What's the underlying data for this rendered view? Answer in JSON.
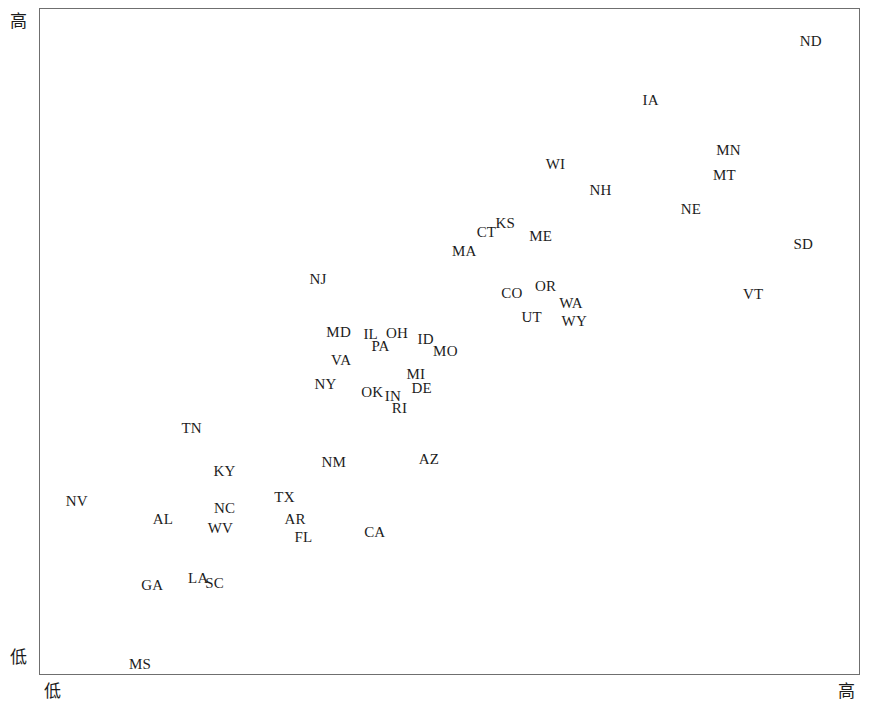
{
  "chart_data": {
    "type": "scatter",
    "title": "",
    "xlabel": "",
    "ylabel": "",
    "xlim": [
      0,
      100
    ],
    "ylim": [
      0,
      100
    ],
    "grid": false,
    "legend": "none",
    "axis_extremes": {
      "y_high": "高",
      "y_low": "低",
      "x_low": "低",
      "x_high": "高"
    },
    "point_label_field": "state",
    "points": [
      {
        "state": "ND",
        "x": 94.0,
        "y": 95.0
      },
      {
        "state": "IA",
        "x": 74.5,
        "y": 86.2
      },
      {
        "state": "MN",
        "x": 84.0,
        "y": 78.7
      },
      {
        "state": "MT",
        "x": 83.5,
        "y": 74.9
      },
      {
        "state": "WI",
        "x": 62.9,
        "y": 76.6
      },
      {
        "state": "NH",
        "x": 68.4,
        "y": 72.7
      },
      {
        "state": "NE",
        "x": 79.4,
        "y": 69.8
      },
      {
        "state": "KS",
        "x": 56.8,
        "y": 67.8
      },
      {
        "state": "CT",
        "x": 54.5,
        "y": 66.4
      },
      {
        "state": "ME",
        "x": 61.1,
        "y": 65.8
      },
      {
        "state": "MA",
        "x": 51.8,
        "y": 63.6
      },
      {
        "state": "SD",
        "x": 93.1,
        "y": 64.6
      },
      {
        "state": "NJ",
        "x": 34.0,
        "y": 59.3
      },
      {
        "state": "OR",
        "x": 61.7,
        "y": 58.3
      },
      {
        "state": "CO",
        "x": 57.6,
        "y": 57.3
      },
      {
        "state": "WA",
        "x": 64.8,
        "y": 55.8
      },
      {
        "state": "VT",
        "x": 87.0,
        "y": 57.1
      },
      {
        "state": "UT",
        "x": 60.0,
        "y": 53.6
      },
      {
        "state": "WY",
        "x": 65.2,
        "y": 53.0
      },
      {
        "state": "MD",
        "x": 36.5,
        "y": 51.4
      },
      {
        "state": "IL",
        "x": 40.4,
        "y": 51.1
      },
      {
        "state": "OH",
        "x": 43.6,
        "y": 51.3
      },
      {
        "state": "ID",
        "x": 47.1,
        "y": 50.4
      },
      {
        "state": "PA",
        "x": 41.6,
        "y": 49.3
      },
      {
        "state": "MO",
        "x": 49.5,
        "y": 48.6
      },
      {
        "state": "VA",
        "x": 36.8,
        "y": 47.2
      },
      {
        "state": "MI",
        "x": 45.9,
        "y": 45.2
      },
      {
        "state": "NY",
        "x": 34.9,
        "y": 43.7
      },
      {
        "state": "DE",
        "x": 46.6,
        "y": 43.1
      },
      {
        "state": "OK",
        "x": 40.6,
        "y": 42.5
      },
      {
        "state": "IN",
        "x": 43.1,
        "y": 41.8
      },
      {
        "state": "RI",
        "x": 43.9,
        "y": 40.0
      },
      {
        "state": "TN",
        "x": 18.6,
        "y": 37.1
      },
      {
        "state": "AZ",
        "x": 47.5,
        "y": 32.4
      },
      {
        "state": "NM",
        "x": 35.9,
        "y": 31.9
      },
      {
        "state": "KY",
        "x": 22.6,
        "y": 30.6
      },
      {
        "state": "TX",
        "x": 29.9,
        "y": 26.7
      },
      {
        "state": "NV",
        "x": 4.6,
        "y": 26.1
      },
      {
        "state": "NC",
        "x": 22.6,
        "y": 25.1
      },
      {
        "state": "AL",
        "x": 15.1,
        "y": 23.4
      },
      {
        "state": "AR",
        "x": 31.2,
        "y": 23.4
      },
      {
        "state": "WV",
        "x": 22.1,
        "y": 22.0
      },
      {
        "state": "CA",
        "x": 40.9,
        "y": 21.5
      },
      {
        "state": "FL",
        "x": 32.2,
        "y": 20.7
      },
      {
        "state": "LA",
        "x": 19.4,
        "y": 14.6
      },
      {
        "state": "SC",
        "x": 21.4,
        "y": 13.8
      },
      {
        "state": "GA",
        "x": 13.8,
        "y": 13.5
      },
      {
        "state": "MS",
        "x": 12.3,
        "y": 1.6
      }
    ]
  },
  "axis_titles": {
    "x_cropped": "",
    "y_cropped": ""
  }
}
